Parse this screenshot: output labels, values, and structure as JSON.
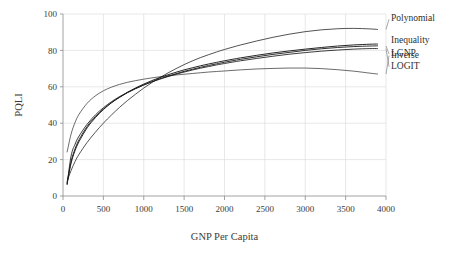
{
  "chart_data": {
    "type": "line",
    "title": "",
    "xlabel": "GNP Per Capita",
    "ylabel": "PQLI",
    "xlim": [
      0,
      4000
    ],
    "ylim": [
      0,
      100
    ],
    "xticks": [
      0,
      500,
      1000,
      1500,
      2000,
      2500,
      3000,
      3500,
      4000
    ],
    "yticks": [
      0,
      20,
      40,
      60,
      80,
      100
    ],
    "xtick_labels": [
      "0",
      "500",
      "1000",
      "1500",
      "2000",
      "2500",
      "3000",
      "3500",
      "4000"
    ],
    "ytick_labels": [
      "0",
      "20",
      "40",
      "60",
      "80",
      "100"
    ],
    "grid": true,
    "grid_axis": "both",
    "legend_position": "right-inline-labels",
    "line_color": "#1a1a1a",
    "grid_color": "#d9d9d9",
    "axis_color": "#8a8a8a",
    "background": "#ffffff",
    "x": [
      50,
      100,
      150,
      200,
      300,
      400,
      500,
      600,
      700,
      800,
      900,
      1000,
      1100,
      1200,
      1300,
      1400,
      1500,
      1600,
      1700,
      1800,
      1900,
      2000,
      2200,
      2400,
      2600,
      2800,
      3000,
      3200,
      3400,
      3600,
      3800,
      3900
    ],
    "series": [
      {
        "name": "Inverse",
        "label": "Inverse",
        "label_y": 76,
        "end_value": 67,
        "values": [
          24.0,
          34.0,
          40.5,
          45.0,
          51.0,
          55.0,
          57.8,
          59.8,
          61.3,
          62.5,
          63.4,
          64.2,
          64.9,
          65.5,
          66.0,
          66.5,
          66.9,
          67.3,
          67.7,
          68.1,
          68.4,
          68.7,
          69.3,
          69.8,
          70.1,
          70.3,
          70.3,
          70.0,
          69.4,
          68.6,
          67.5,
          67.0
        ]
      },
      {
        "name": "Polynomial",
        "label": "Polynomial",
        "label_y": 96,
        "end_value": 91.5,
        "values": [
          8.0,
          14.0,
          19.0,
          23.0,
          29.5,
          35.0,
          40.0,
          44.5,
          48.7,
          52.5,
          56.0,
          59.3,
          62.3,
          65.1,
          67.6,
          70.0,
          72.2,
          74.2,
          76.0,
          77.6,
          79.1,
          80.5,
          83.0,
          85.2,
          87.2,
          88.9,
          90.3,
          91.3,
          91.9,
          92.1,
          91.8,
          91.5
        ]
      },
      {
        "name": "Inequality",
        "label": "Inequality",
        "label_y": 84,
        "end_value": 83.5,
        "values": [
          6.5,
          18.0,
          25.0,
          30.0,
          37.5,
          43.0,
          47.5,
          51.2,
          54.3,
          57.0,
          59.4,
          61.5,
          63.4,
          65.1,
          66.6,
          68.0,
          69.3,
          70.4,
          71.5,
          72.5,
          73.4,
          74.3,
          75.9,
          77.3,
          78.6,
          79.7,
          80.7,
          81.6,
          82.4,
          83.0,
          83.4,
          83.5
        ]
      },
      {
        "name": "LGNP",
        "label": "LGNP",
        "label_y": 77,
        "end_value": 82.5,
        "values": [
          7.0,
          19.0,
          26.0,
          31.0,
          38.3,
          43.6,
          47.8,
          51.3,
          54.2,
          56.8,
          59.0,
          61.0,
          62.8,
          64.4,
          65.9,
          67.2,
          68.5,
          69.6,
          70.7,
          71.7,
          72.6,
          73.5,
          75.1,
          76.5,
          77.8,
          78.9,
          80.0,
          80.9,
          81.6,
          82.1,
          82.4,
          82.5
        ]
      },
      {
        "name": "LOGIT",
        "label": "LOGIT",
        "label_y": 70,
        "end_value": 81.0,
        "values": [
          6.0,
          22.0,
          28.5,
          33.0,
          39.5,
          44.5,
          48.5,
          51.8,
          54.6,
          57.0,
          59.1,
          61.0,
          62.7,
          64.2,
          65.6,
          66.9,
          68.1,
          69.2,
          70.2,
          71.1,
          72.0,
          72.8,
          74.3,
          75.6,
          76.8,
          77.9,
          78.8,
          79.6,
          80.2,
          80.7,
          81.0,
          81.0
        ]
      }
    ]
  }
}
